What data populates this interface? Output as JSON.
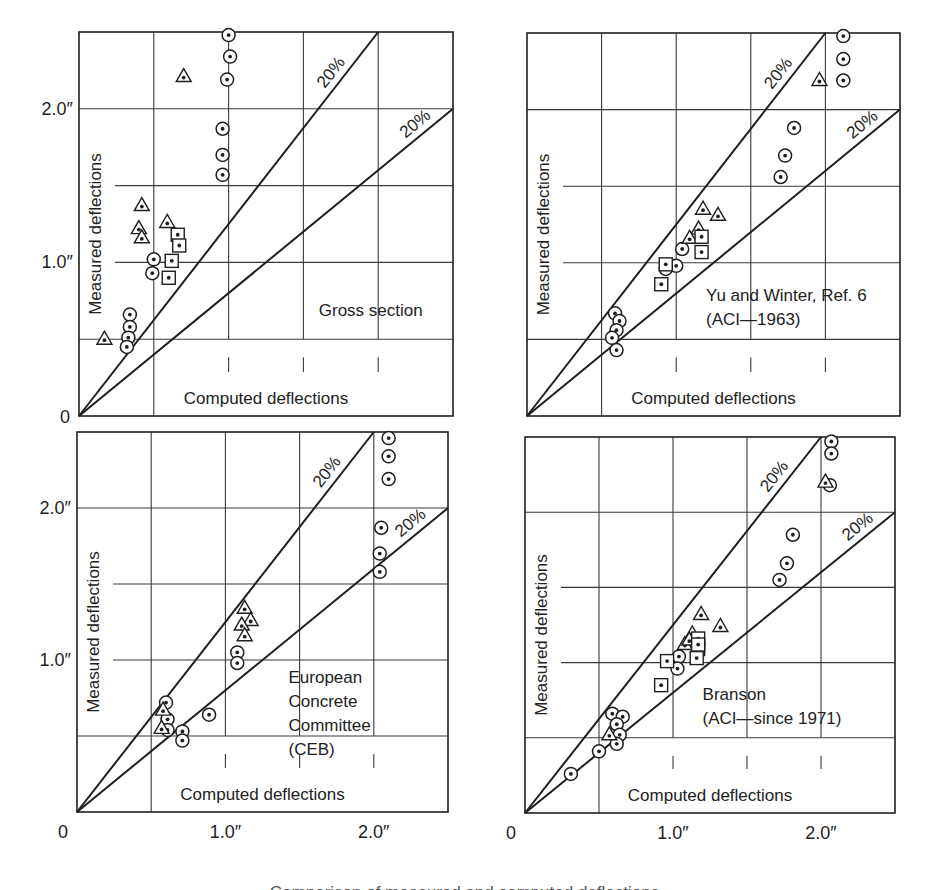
{
  "figure": {
    "caption": "Comparison of measured and computed deflections"
  },
  "axis_labels": {
    "y_title": "Measured deflections",
    "x_title": "Computed deflections",
    "origin": "0",
    "y_tick_1": "1.0″",
    "y_tick_2": "2.0″",
    "x_tick_1": "1.0″",
    "x_tick_2": "2.0″",
    "band_label": "20%"
  },
  "colors": {
    "ink": "#1e1e1e",
    "grid": "#3a3a3a",
    "background": "#ffffff"
  },
  "chart_data": [
    {
      "type": "scatter",
      "title": "Gross section",
      "title_lines": [
        "Gross section"
      ],
      "xlabel": "Computed deflections",
      "ylabel": "Measured deflections",
      "xlim": [
        0,
        2.5
      ],
      "ylim": [
        0,
        2.5
      ],
      "grid": true,
      "grid_step": 0.5,
      "x_ticks_shown": [],
      "y_ticks_shown": [
        "0",
        "1.0″",
        "2.0″"
      ],
      "reference_lines": [
        {
          "label": "20%",
          "slope": 1.25,
          "description": "measured 20% above computed"
        },
        {
          "label": "20%",
          "slope": 0.8,
          "description": "measured 20% below computed"
        }
      ],
      "series": [
        {
          "name": "circle",
          "marker": "circle-dot",
          "points": [
            [
              1.0,
              2.48
            ],
            [
              1.01,
              2.34
            ],
            [
              0.99,
              2.19
            ],
            [
              0.96,
              1.87
            ],
            [
              0.96,
              1.7
            ],
            [
              0.96,
              1.57
            ],
            [
              0.5,
              1.02
            ],
            [
              0.49,
              0.93
            ],
            [
              0.34,
              0.66
            ],
            [
              0.34,
              0.58
            ],
            [
              0.33,
              0.51
            ],
            [
              0.32,
              0.45
            ]
          ]
        },
        {
          "name": "triangle",
          "marker": "triangle-dot",
          "points": [
            [
              0.7,
              2.21
            ],
            [
              0.42,
              1.37
            ],
            [
              0.4,
              1.22
            ],
            [
              0.42,
              1.16
            ],
            [
              0.59,
              1.26
            ],
            [
              0.17,
              0.5
            ]
          ]
        },
        {
          "name": "square",
          "marker": "square-dot",
          "points": [
            [
              0.66,
              1.18
            ],
            [
              0.67,
              1.11
            ],
            [
              0.62,
              1.01
            ],
            [
              0.6,
              0.9
            ]
          ]
        }
      ]
    },
    {
      "type": "scatter",
      "title": "Yu and Winter, Ref. 6 (ACI—1963)",
      "title_lines": [
        "Yu and Winter, Ref. 6",
        "(ACI—1963)"
      ],
      "xlabel": "Computed deflections",
      "ylabel": "Measured deflections",
      "xlim": [
        0,
        2.5
      ],
      "ylim": [
        0,
        2.5
      ],
      "grid": true,
      "grid_step": 0.5,
      "x_ticks_shown": [],
      "y_ticks_shown": [],
      "reference_lines": [
        {
          "label": "20%",
          "slope": 1.25
        },
        {
          "label": "20%",
          "slope": 0.8
        }
      ],
      "series": [
        {
          "name": "circle",
          "marker": "circle-dot",
          "points": [
            [
              2.12,
              2.48
            ],
            [
              2.12,
              2.33
            ],
            [
              2.12,
              2.19
            ],
            [
              1.79,
              1.88
            ],
            [
              1.73,
              1.7
            ],
            [
              1.7,
              1.56
            ],
            [
              1.04,
              1.09
            ],
            [
              1.0,
              0.98
            ],
            [
              0.93,
              0.96
            ],
            [
              0.59,
              0.67
            ],
            [
              0.62,
              0.62
            ],
            [
              0.6,
              0.56
            ],
            [
              0.57,
              0.51
            ],
            [
              0.6,
              0.43
            ]
          ]
        },
        {
          "name": "triangle",
          "marker": "triangle-dot",
          "points": [
            [
              1.96,
              2.19
            ],
            [
              1.18,
              1.35
            ],
            [
              1.28,
              1.31
            ],
            [
              1.15,
              1.22
            ],
            [
              1.09,
              1.16
            ]
          ]
        },
        {
          "name": "square",
          "marker": "square-dot",
          "points": [
            [
              1.17,
              1.17
            ],
            [
              1.17,
              1.07
            ],
            [
              0.93,
              0.99
            ],
            [
              0.9,
              0.86
            ]
          ]
        }
      ]
    },
    {
      "type": "scatter",
      "title": "European Concrete Committee (CEB)",
      "title_lines": [
        "European",
        "Concrete",
        "Committee",
        "(CEB)"
      ],
      "xlabel": "Computed deflections",
      "ylabel": "Measured deflections",
      "xlim": [
        0,
        2.5
      ],
      "ylim": [
        0,
        2.5
      ],
      "grid": true,
      "grid_step": 0.5,
      "x_ticks_shown": [
        "0",
        "1.0″",
        "2.0″"
      ],
      "y_ticks_shown": [
        "1.0″",
        "2.0″"
      ],
      "reference_lines": [
        {
          "label": "20%",
          "slope": 1.25
        },
        {
          "label": "20%",
          "slope": 0.8
        }
      ],
      "series": [
        {
          "name": "circle",
          "marker": "circle-dot",
          "points": [
            [
              2.1,
              2.46
            ],
            [
              2.1,
              2.34
            ],
            [
              2.1,
              2.19
            ],
            [
              2.05,
              1.87
            ],
            [
              2.04,
              1.7
            ],
            [
              2.04,
              1.58
            ],
            [
              1.08,
              1.05
            ],
            [
              1.08,
              0.98
            ],
            [
              0.89,
              0.64
            ],
            [
              0.6,
              0.72
            ],
            [
              0.61,
              0.61
            ],
            [
              0.61,
              0.54
            ],
            [
              0.71,
              0.53
            ],
            [
              0.71,
              0.47
            ]
          ]
        },
        {
          "name": "triangle",
          "marker": "triangle-dot",
          "points": [
            [
              1.13,
              1.34
            ],
            [
              1.17,
              1.26
            ],
            [
              1.11,
              1.23
            ],
            [
              1.13,
              1.16
            ],
            [
              0.57,
              0.55
            ],
            [
              0.58,
              0.67
            ]
          ]
        },
        {
          "name": "square",
          "marker": "square-dot",
          "points": []
        }
      ]
    },
    {
      "type": "scatter",
      "title": "Branson (ACI—since 1971)",
      "title_lines": [
        "Branson",
        "(ACI—since 1971)"
      ],
      "xlabel": "Computed deflections",
      "ylabel": "Measured deflections",
      "xlim": [
        0,
        2.5
      ],
      "ylim": [
        0,
        2.5
      ],
      "grid": true,
      "grid_step": 0.5,
      "x_ticks_shown": [
        "0",
        "1.0″",
        "2.0″"
      ],
      "y_ticks_shown": [],
      "reference_lines": [
        {
          "label": "20%",
          "slope": 1.25
        },
        {
          "label": "20%",
          "slope": 0.8
        }
      ],
      "series": [
        {
          "name": "circle",
          "marker": "circle-dot",
          "points": [
            [
              2.07,
              2.47
            ],
            [
              2.07,
              2.39
            ],
            [
              2.06,
              2.18
            ],
            [
              1.81,
              1.85
            ],
            [
              1.77,
              1.66
            ],
            [
              1.72,
              1.55
            ],
            [
              1.04,
              1.04
            ],
            [
              1.03,
              0.96
            ],
            [
              0.59,
              0.66
            ],
            [
              0.66,
              0.64
            ],
            [
              0.62,
              0.59
            ],
            [
              0.64,
              0.52
            ],
            [
              0.62,
              0.46
            ],
            [
              0.5,
              0.41
            ],
            [
              0.31,
              0.26
            ]
          ]
        },
        {
          "name": "triangle",
          "marker": "triangle-dot",
          "points": [
            [
              1.19,
              1.32
            ],
            [
              1.32,
              1.24
            ],
            [
              1.13,
              1.19
            ],
            [
              1.08,
              1.12
            ],
            [
              1.11,
              1.15
            ],
            [
              0.57,
              0.52
            ],
            [
              2.03,
              2.2
            ]
          ]
        },
        {
          "name": "square",
          "marker": "square-dot",
          "points": [
            [
              0.96,
              1.01
            ],
            [
              0.92,
              0.85
            ],
            [
              1.17,
              1.16
            ],
            [
              1.17,
              1.09
            ],
            [
              1.16,
              1.03
            ],
            [
              1.17,
              1.12
            ]
          ]
        }
      ]
    }
  ]
}
